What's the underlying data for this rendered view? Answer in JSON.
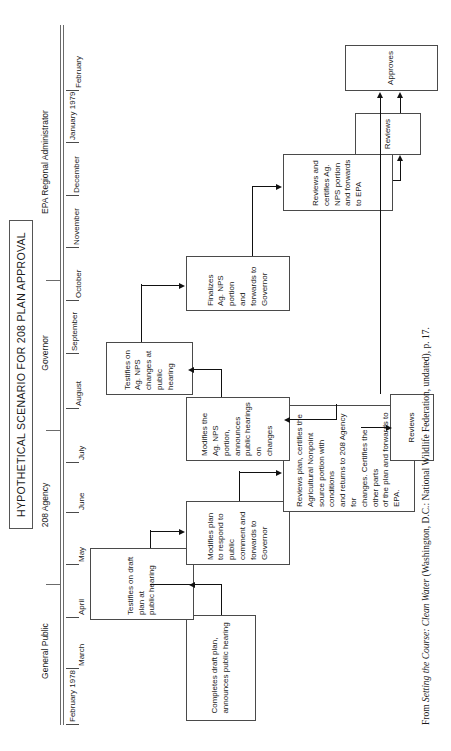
{
  "figure": {
    "title": "HYPOTHETICAL SCENARIO FOR 208 PLAN APPROVAL",
    "orientation": "rotated-90-ccw",
    "columns": [
      {
        "id": "general-public",
        "label": "General Public"
      },
      {
        "id": "208-agency",
        "label": "208 Agency"
      },
      {
        "id": "governor",
        "label": "Governor"
      },
      {
        "id": "epa-regional-administrator",
        "label": "EPA Regional Administrator"
      }
    ],
    "timeline": [
      {
        "id": "feb-1978",
        "label": "February 1978"
      },
      {
        "id": "mar",
        "label": "March"
      },
      {
        "id": "apr",
        "label": "April"
      },
      {
        "id": "may",
        "label": "May"
      },
      {
        "id": "jun",
        "label": "June"
      },
      {
        "id": "jul",
        "label": "July"
      },
      {
        "id": "aug",
        "label": "August"
      },
      {
        "id": "sep",
        "label": "September"
      },
      {
        "id": "oct",
        "label": "October"
      },
      {
        "id": "nov",
        "label": "November"
      },
      {
        "id": "dec",
        "label": "December"
      },
      {
        "id": "jan-1979",
        "label": "January 1979"
      },
      {
        "id": "feb-1979",
        "label": "February"
      }
    ],
    "nodes": [
      {
        "id": "completes-draft-plan",
        "column": "208 Agency",
        "time": "February 1978",
        "text": "Completes draft plan,\nannounces public hearing"
      },
      {
        "id": "testifies-draft-plan",
        "column": "General Public",
        "time": "April",
        "text": "Testifies on draft plan at\npublic hearing"
      },
      {
        "id": "modifies-plan",
        "column": "208 Agency",
        "time": "May",
        "text": "Modifies plan to respond to\npublic comment and\nforwards to Governor"
      },
      {
        "id": "governor-reviews-certifies",
        "column": "Governor",
        "time": "June",
        "text": "Reviews plan, certifies the\nAgricultural Nonpoint\nsource portion with conditions\nand returns to 208 Agency for\nchanges. Certifies the other parts\nof the plan and forwards to EPA."
      },
      {
        "id": "epa-reviews-1",
        "column": "EPA Regional Administrator",
        "time": "July",
        "text": "Reviews"
      },
      {
        "id": "modifies-ag-nps",
        "column": "208 Agency",
        "time": "July",
        "text": "Modifies the Ag. NPS portion,\nannounces public hearings on\nchanges"
      },
      {
        "id": "testifies-ag-nps",
        "column": "General Public",
        "time": "August",
        "text": "Testifies on Ag. NPS\nchanges at public hearing"
      },
      {
        "id": "finalizes-ag-nps",
        "column": "208 Agency",
        "time": "October",
        "text": "Finalizes Ag. NPS portion\nand forwards to Governor"
      },
      {
        "id": "governor-reviews-certifies-2",
        "column": "Governor",
        "time": "December",
        "text": "Reviews and certifies Ag.\nNPS portion and forwards\nto EPA"
      },
      {
        "id": "epa-reviews-2",
        "column": "EPA Regional Administrator",
        "time": "January 1979",
        "text": "Reviews"
      },
      {
        "id": "epa-approves",
        "column": "EPA Regional Administrator",
        "time": "February",
        "text": "Approves"
      }
    ],
    "flows": [
      {
        "from": "completes-draft-plan",
        "to": "testifies-draft-plan"
      },
      {
        "from": "testifies-draft-plan",
        "to": "modifies-plan"
      },
      {
        "from": "modifies-plan",
        "to": "governor-reviews-certifies"
      },
      {
        "from": "governor-reviews-certifies",
        "to": "epa-reviews-1"
      },
      {
        "from": "governor-reviews-certifies",
        "to": "modifies-ag-nps"
      },
      {
        "from": "modifies-ag-nps",
        "to": "testifies-ag-nps"
      },
      {
        "from": "testifies-ag-nps",
        "to": "finalizes-ag-nps"
      },
      {
        "from": "finalizes-ag-nps",
        "to": "governor-reviews-certifies-2"
      },
      {
        "from": "governor-reviews-certifies-2",
        "to": "epa-reviews-2"
      },
      {
        "from": "epa-reviews-1",
        "to": "epa-approves"
      },
      {
        "from": "epa-reviews-2",
        "to": "epa-approves"
      }
    ]
  },
  "citation": {
    "prefix": "From ",
    "work": "Setting the Course: Clean Water",
    "suffix": " (Washington, D.C.: National Wildlife Federation, undated), p. 17."
  }
}
